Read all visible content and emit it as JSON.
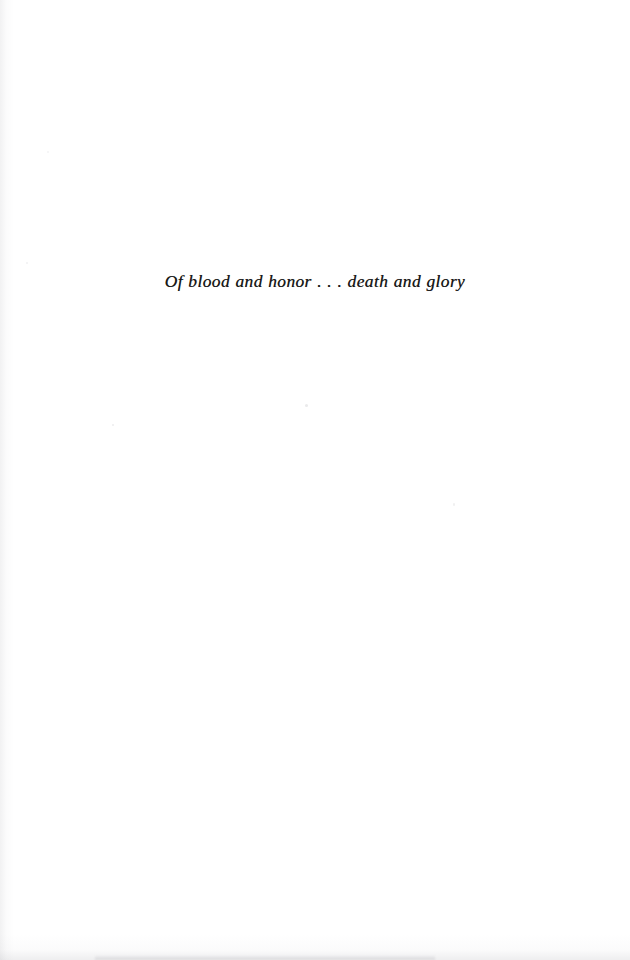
{
  "page": {
    "kind": "book-epigraph-page",
    "background_color": "#ffffff",
    "ink_color": "#161616",
    "width": 630,
    "height": 960
  },
  "epigraph": {
    "line": "Of blood and honor . . . death and glory"
  }
}
